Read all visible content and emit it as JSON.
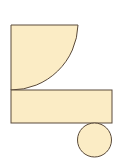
{
  "diagram": {
    "fill": "#fbecc5",
    "stroke": "#5a4a3a",
    "shapes": [
      {
        "type": "quarter-circle",
        "cx": 11,
        "cy": 25,
        "r": 67
      },
      {
        "type": "rectangle",
        "x": 11,
        "y": 90,
        "width": 101,
        "height": 33
      },
      {
        "type": "circle",
        "cx": 94.5,
        "cy": 140,
        "r": 17
      }
    ]
  }
}
